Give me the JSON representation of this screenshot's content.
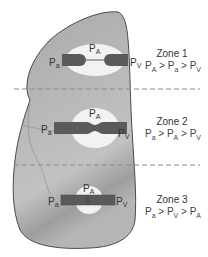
{
  "diagram": {
    "colors": {
      "lung_fill": "#a8a8a8",
      "lung_stroke": "#4a4a4a",
      "alveolus_fill": "#f2f2f2",
      "vessel_fill": "#5a5a5a",
      "dashed_line": "#8a8a8a"
    },
    "vessel_labels": {
      "arterial": "P",
      "arterial_sub": "a",
      "alveolar": "P",
      "alveolar_sub": "A",
      "venous": "P",
      "venous_sub": "V"
    },
    "zones": [
      {
        "name": "Zone 1",
        "relation": [
          {
            "p": "P",
            "sub": "A"
          },
          {
            "op": ">"
          },
          {
            "p": "P",
            "sub": "a"
          },
          {
            "op": ">"
          },
          {
            "p": "P",
            "sub": "V"
          }
        ],
        "vessel_state": "collapsed"
      },
      {
        "name": "Zone 2",
        "relation": [
          {
            "p": "P",
            "sub": "a"
          },
          {
            "op": ">"
          },
          {
            "p": "P",
            "sub": "A"
          },
          {
            "op": ">"
          },
          {
            "p": "P",
            "sub": "V"
          }
        ],
        "vessel_state": "narrowed"
      },
      {
        "name": "Zone 3",
        "relation": [
          {
            "p": "P",
            "sub": "a"
          },
          {
            "op": ">"
          },
          {
            "p": "P",
            "sub": "V"
          },
          {
            "op": ">"
          },
          {
            "p": "P",
            "sub": "A"
          }
        ],
        "vessel_state": "open"
      }
    ],
    "zone1_text": "Zone 1",
    "zone2_text": "Zone 2",
    "zone3_text": "Zone 3"
  }
}
